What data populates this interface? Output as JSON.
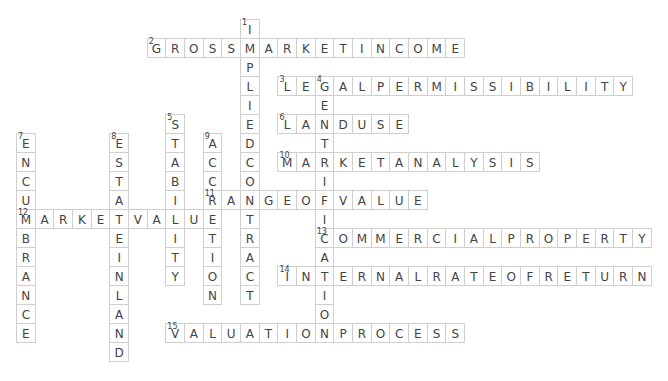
{
  "puzzle": {
    "grid": {
      "origin_x": 16,
      "origin_y": 19,
      "cell_w": 18.67,
      "cell_h": 19,
      "border_color": "#cfcfcf",
      "text_color": "#444444"
    },
    "words": [
      {
        "number": 1,
        "direction": "down",
        "answer": "IMPLIEDCONTRACT",
        "row": 0,
        "col": 12
      },
      {
        "number": 2,
        "direction": "across",
        "answer": "GROSSMARKETINCOME",
        "row": 1,
        "col": 7
      },
      {
        "number": 3,
        "direction": "across",
        "answer": "LEGALPERMISSIBILITY",
        "row": 3,
        "col": 14
      },
      {
        "number": 4,
        "direction": "down",
        "answer": "GENTRIFICATION",
        "row": 3,
        "col": 16
      },
      {
        "number": 5,
        "direction": "down",
        "answer": "STABILITY",
        "row": 5,
        "col": 8
      },
      {
        "number": 6,
        "direction": "across",
        "answer": "LANDUSE",
        "row": 5,
        "col": 14
      },
      {
        "number": 7,
        "direction": "down",
        "answer": "ENCUMBRANCE",
        "row": 6,
        "col": 0
      },
      {
        "number": 8,
        "direction": "down",
        "answer": "ESTATEINLAND",
        "row": 6,
        "col": 5
      },
      {
        "number": 9,
        "direction": "down",
        "answer": "ACCRETION",
        "row": 6,
        "col": 10
      },
      {
        "number": 10,
        "direction": "across",
        "answer": "MARKETANALYSIS",
        "row": 7,
        "col": 14
      },
      {
        "number": 11,
        "direction": "across",
        "answer": "RANGEOFVALUE",
        "row": 9,
        "col": 10
      },
      {
        "number": 12,
        "direction": "across",
        "answer": "MARKETVALUE",
        "row": 10,
        "col": 0
      },
      {
        "number": 13,
        "direction": "across",
        "answer": "COMMERCIALPROPERTY",
        "row": 11,
        "col": 16
      },
      {
        "number": 14,
        "direction": "across",
        "answer": "INTERNALRATEOFRETURN",
        "row": 13,
        "col": 14
      },
      {
        "number": 15,
        "direction": "across",
        "answer": "VALUATIONPROCESS",
        "row": 16,
        "col": 8
      }
    ]
  }
}
